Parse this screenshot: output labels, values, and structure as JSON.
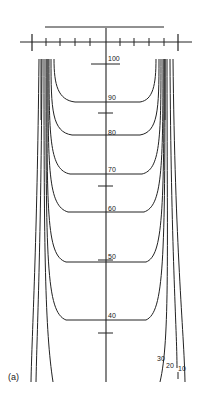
{
  "figure": {
    "panel_label": "(a)",
    "type": "isodose-curves",
    "center_labels": [
      "100",
      "90",
      "80",
      "70",
      "60",
      "50",
      "40"
    ],
    "edge_labels": [
      "30",
      "20",
      "10"
    ],
    "line_color": "#222222",
    "background": "#ffffff"
  }
}
